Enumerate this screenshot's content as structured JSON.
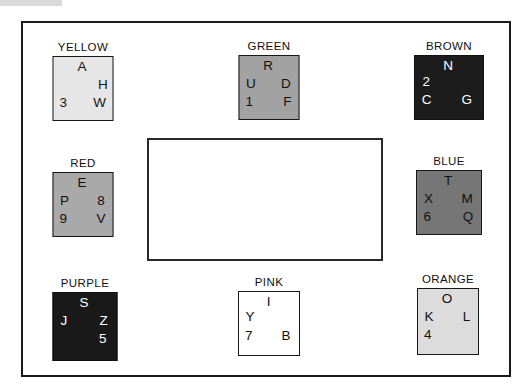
{
  "diagram": {
    "background": "#ffffff",
    "frame_color": "#1a1a1a",
    "center_rect": {
      "name": "empty-center-rectangle",
      "fill": "#ffffff",
      "border": "#2a2a2a"
    },
    "groups": [
      {
        "id": "yellow",
        "label": "YELLOW",
        "fill": "#e6e6e6",
        "text_color": "#151515",
        "border": "#171717",
        "cells": [
          {
            "char": "A",
            "pos": "top-center"
          },
          {
            "char": "H",
            "pos": "middle-right"
          },
          {
            "char": "3",
            "pos": "bottom-left"
          },
          {
            "char": "W",
            "pos": "bottom-right"
          }
        ]
      },
      {
        "id": "green",
        "label": "GREEN",
        "fill": "#a2a2a2",
        "text_color": "#101010",
        "border": "#171717",
        "cells": [
          {
            "char": "R",
            "pos": "top-center"
          },
          {
            "char": "U",
            "pos": "middle-left"
          },
          {
            "char": "D",
            "pos": "middle-right"
          },
          {
            "char": "1",
            "pos": "bottom-left"
          },
          {
            "char": "F",
            "pos": "bottom-right"
          }
        ]
      },
      {
        "id": "brown",
        "label": "BROWN",
        "fill": "#1c1c1c",
        "text_color": "#ffffff",
        "border": "#111111",
        "cells": [
          {
            "char": "N",
            "pos": "top-center"
          },
          {
            "char": "2",
            "pos": "middle-left"
          },
          {
            "char": "C",
            "pos": "bottom-left"
          },
          {
            "char": "G",
            "pos": "bottom-right"
          }
        ]
      },
      {
        "id": "red",
        "label": "RED",
        "fill": "#a9a9a9",
        "text_color": "#101010",
        "border": "#171717",
        "cells": [
          {
            "char": "E",
            "pos": "top-center"
          },
          {
            "char": "P",
            "pos": "middle-left"
          },
          {
            "char": "8",
            "pos": "middle-right"
          },
          {
            "char": "9",
            "pos": "bottom-left"
          },
          {
            "char": "V",
            "pos": "bottom-right"
          }
        ]
      },
      {
        "id": "blue",
        "label": "BLUE",
        "fill": "#767676",
        "text_color": "#121212",
        "border": "#171717",
        "cells": [
          {
            "char": "T",
            "pos": "top-center"
          },
          {
            "char": "X",
            "pos": "middle-left"
          },
          {
            "char": "M",
            "pos": "middle-right"
          },
          {
            "char": "6",
            "pos": "bottom-left"
          },
          {
            "char": "Q",
            "pos": "bottom-right"
          }
        ]
      },
      {
        "id": "purple",
        "label": "PURPLE",
        "fill": "#191919",
        "text_color": "#ffffff",
        "border": "#111111",
        "cells": [
          {
            "char": "S",
            "pos": "top-center"
          },
          {
            "char": "J",
            "pos": "middle-left"
          },
          {
            "char": "Z",
            "pos": "middle-right"
          },
          {
            "char": "5",
            "pos": "bottom-right"
          }
        ]
      },
      {
        "id": "pink",
        "label": "PINK",
        "fill": "#ffffff",
        "text_color": "#101010",
        "border": "#171717",
        "cells": [
          {
            "char": "I",
            "pos": "top-center"
          },
          {
            "char": "Y",
            "pos": "middle-left"
          },
          {
            "char": "7",
            "pos": "bottom-left"
          },
          {
            "char": "B",
            "pos": "bottom-right"
          }
        ]
      },
      {
        "id": "orange",
        "label": "ORANGE",
        "fill": "#dcdcdc",
        "text_color": "#101010",
        "border": "#171717",
        "cells": [
          {
            "char": "O",
            "pos": "top-center"
          },
          {
            "char": "K",
            "pos": "middle-left"
          },
          {
            "char": "L",
            "pos": "middle-right"
          },
          {
            "char": "4",
            "pos": "bottom-left"
          }
        ]
      }
    ]
  }
}
